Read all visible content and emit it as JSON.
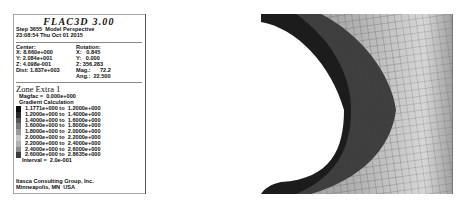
{
  "app": {
    "name": "FLAC3D 3.00"
  },
  "header": {
    "step_line": "Step 3655  Model Perspective",
    "date_line": "23:08:54 Thu Oct 01 2015"
  },
  "view": {
    "center_label": "Center:",
    "center": [
      "X: 8.660e+000",
      "Y: 2.084e+001",
      "Z: 4.098e-001"
    ],
    "dist": "Dist: 1.837e+003",
    "rotation_label": "Rotation:",
    "rotation": [
      "X:   0.845",
      "Y:   0.000",
      "Z: 356.283"
    ],
    "mag": "Mag.:      72.2",
    "ang": "Ang.:  22.500"
  },
  "contour": {
    "title": "Zone Extra 1",
    "magfac": "Magfac =  0.000e+000",
    "method": "Gradient Calculation",
    "ranges": [
      {
        "label": "1.1771e+000 to  1.2000e+000",
        "color": "#0a0a0a"
      },
      {
        "label": "1.2000e+000 to  1.4000e+000",
        "color": "#2a2a2a"
      },
      {
        "label": "1.4000e+000 to  1.6000e+000",
        "color": "#555555"
      },
      {
        "label": "1.6000e+000 to  1.8000e+000",
        "color": "#7a7a7a"
      },
      {
        "label": "1.8000e+000 to  2.0000e+000",
        "color": "#9a9a9a"
      },
      {
        "label": "2.0000e+000 to  2.2000e+000",
        "color": "#c8c8c8"
      },
      {
        "label": "2.2000e+000 to  2.4000e+000",
        "color": "#b0b0b0"
      },
      {
        "label": "2.4000e+000 to  2.6000e+000",
        "color": "#8c8c8c"
      },
      {
        "label": "2.6000e+000 to  2.8635e+000",
        "color": "#3c3c3c"
      }
    ],
    "interval": "Interval =  2.0e-001"
  },
  "footer": {
    "line1": "Itasca Consulting Group, Inc.",
    "line2": "Minneapolis, MN  USA"
  },
  "caption": ""
}
